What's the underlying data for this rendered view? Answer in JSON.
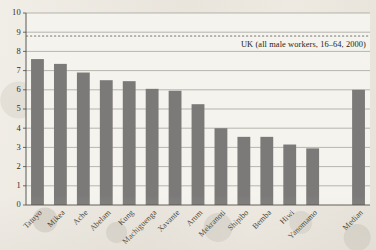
{
  "chart_data": {
    "type": "bar",
    "title": "",
    "subtitle": "",
    "xlabel": "",
    "ylabel": "",
    "ylim": [
      0,
      10
    ],
    "ytick_step": 1,
    "yticks": [
      "10",
      "9",
      "8",
      "7",
      "6",
      "5",
      "4",
      "3",
      "2",
      "1",
      "0"
    ],
    "grid": true,
    "legend": "none",
    "bar_color": "#7c7a78",
    "categories": [
      "Tatuyo",
      "Mikea",
      "Ache",
      "Abelam",
      "Kung",
      "Machiguenga",
      "Xavante",
      "Arum",
      "Mekranoti",
      "Shipibo",
      "Bemba",
      "Hiwi",
      "Yanomamo",
      "Median"
    ],
    "values": [
      7.6,
      7.35,
      6.9,
      6.5,
      6.45,
      6.05,
      5.95,
      5.25,
      4.0,
      3.55,
      3.55,
      3.15,
      2.95,
      6.0
    ],
    "gap_before_last": true,
    "annotations": [
      {
        "name": "uk-reference-line",
        "text": "UK (all male workers, 16–64, 2000)",
        "value": 8.8,
        "style": "dashed-horizontal-line"
      }
    ]
  }
}
